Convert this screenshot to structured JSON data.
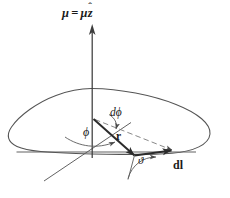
{
  "figure": {
    "kind": "physics-vector-diagram",
    "background_color": "#ffffff",
    "ink_color": "#4a4a4a",
    "label_color": "#1a1a1a",
    "width": 230,
    "height": 198
  },
  "labels": {
    "magnetic_moment": {
      "name": "mu-equals-mu-z-hat",
      "mu_symbol": "μ",
      "equals": "=",
      "mu_scalar": "μ",
      "z_hat_letter": "z",
      "z_hat_carat": "ˆ",
      "full_text": "μ = μẑ"
    },
    "d_phi": "dϕ",
    "phi": "ϕ",
    "r_vector": "r",
    "theta": "ϑ",
    "dl_vector": "dl"
  },
  "elements": {
    "loop_curve": "closed-current-loop",
    "mu_arrow": "vertical-magnetic-moment-arrow",
    "r_arrow": "radius-vector-arrow",
    "dl_arrow": "line-element-arrow",
    "dashed_ray": "dashed-reference-ray",
    "baseline": "horizontal-reference-line",
    "skew_axis": "skew-in-plane-axis",
    "phi_arc": "phi-angle-arc",
    "dphi_arc": "d-phi-angle-arc",
    "theta_arc": "theta-angle-arc"
  }
}
